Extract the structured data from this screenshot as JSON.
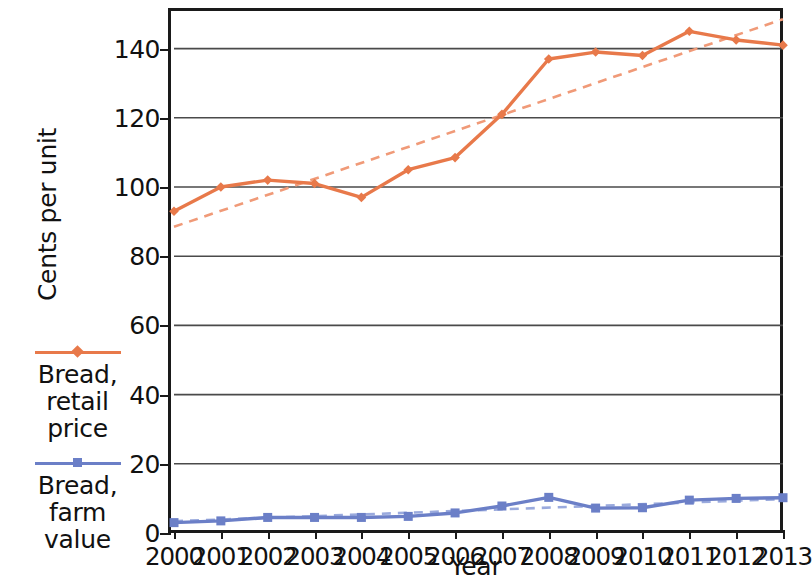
{
  "chart_data": {
    "type": "line",
    "title": "",
    "xlabel": "Year",
    "ylabel": "Cents per unit",
    "xlim": [
      2000,
      2013
    ],
    "ylim": [
      0,
      150
    ],
    "yticks": [
      0,
      20,
      40,
      60,
      80,
      100,
      120,
      140
    ],
    "grid": "horizontal",
    "legend_position": "left-outside",
    "categories": [
      "2000",
      "2001",
      "2002",
      "2003",
      "2004",
      "2005",
      "2006",
      "2007",
      "2008",
      "2009",
      "2010",
      "2011",
      "2012",
      "2013"
    ],
    "x": [
      2000,
      2001,
      2002,
      2003,
      2004,
      2005,
      2006,
      2007,
      2008,
      2009,
      2010,
      2011,
      2012,
      2013
    ],
    "series": [
      {
        "name": "Bread, retail price",
        "color": "#E8794A",
        "marker": "diamond",
        "style": "solid",
        "values": [
          93,
          100,
          102,
          101,
          97,
          105,
          108.5,
          121,
          137,
          139,
          138,
          145,
          142.5,
          141
        ]
      },
      {
        "name": "Bread, farm value",
        "color": "#6B7FC7",
        "marker": "square",
        "style": "solid",
        "values": [
          3,
          3.5,
          4.5,
          4.5,
          4.5,
          4.8,
          5.8,
          7.8,
          10.3,
          7.2,
          7.3,
          9.5,
          10,
          10.2
        ]
      }
    ],
    "trendlines": [
      {
        "name": "Bread, retail price trend",
        "color": "#F09A78",
        "style": "dashed",
        "for_series": "Bread, retail price",
        "start": [
          2000,
          88.5
        ],
        "end": [
          2013,
          148.5
        ]
      },
      {
        "name": "Bread, farm value trend",
        "color": "#9AAADD",
        "style": "dashed",
        "for_series": "Bread, farm value",
        "start": [
          2000,
          3.4
        ],
        "end": [
          2013,
          9.8
        ]
      }
    ]
  },
  "legend": {
    "entries": [
      {
        "label": "Bread,\nretail\nprice",
        "color": "#E8794A",
        "marker": "diamond"
      },
      {
        "label": "Bread,\nfarm\nvalue",
        "color": "#6B7FC7",
        "marker": "square"
      }
    ]
  },
  "colors": {
    "retail": "#E8794A",
    "retail_trend": "#F09A78",
    "farm": "#6B7FC7",
    "farm_trend": "#9AAADD",
    "axis": "#1a1a1a",
    "grid": "#4a4a4a",
    "background": "#ffffff"
  }
}
